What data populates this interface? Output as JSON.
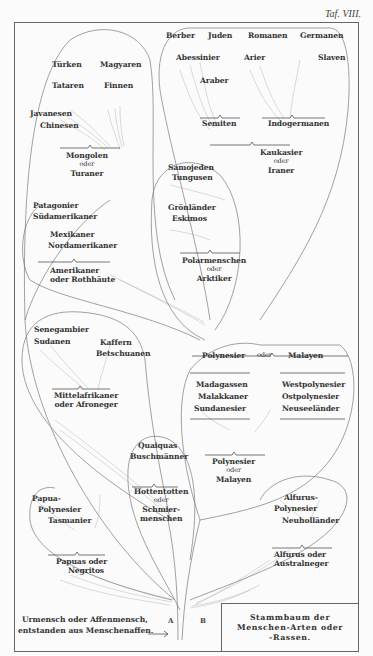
{
  "plate": {
    "title": "Taf. VIII.",
    "legend": {
      "line1": "Stammbaum der",
      "line2": "Menschen-Arten oder",
      "line3": "-Rassen."
    },
    "origin": {
      "line1": "Urmensch oder Affenmensch,",
      "line2": "entstanden aus Menschenaffen.",
      "arrow": "⟶",
      "root_a": "A",
      "root_b": "B"
    }
  },
  "tree": {
    "mongolen": {
      "group": [
        "Mongolen",
        "oder",
        "Turaner"
      ],
      "leaves": [
        "Türken",
        "Magyaren",
        "Tataren",
        "Finnen",
        "Javanesen",
        "Chinesen"
      ]
    },
    "kaukasier": {
      "group": [
        "Kaukasier",
        "oder",
        "Iraner"
      ],
      "subgroups": {
        "semiten": {
          "label": "Semiten",
          "leaves": [
            "Berber",
            "Juden",
            "Abessinier",
            "Araber"
          ]
        },
        "indogermanen": {
          "label": "Indogermanen",
          "leaves": [
            "Romanen",
            "Germanen",
            "Arier",
            "Slaven"
          ]
        }
      }
    },
    "arktiker": {
      "group": [
        "Polarmenschen",
        "oder",
        "Arktiker"
      ],
      "leaves": [
        "Samojeden",
        "Tungusen",
        "Grönländer",
        "Eskimos"
      ]
    },
    "amerikaner": {
      "group": [
        "Amerikaner",
        "oder Rothhäute"
      ],
      "leaves": [
        "Patagonier",
        "Südamerikaner",
        "Mexikaner",
        "Nordamerikaner"
      ]
    },
    "afroneger": {
      "group": [
        "Mittelafrikaner",
        "oder Afroneger"
      ],
      "leaves": [
        "Senegambier",
        "Sudanen",
        "Kaffern",
        "Betschuanen"
      ]
    },
    "polynesier_top": {
      "label": [
        "Polynesier",
        "oder",
        "Malayen"
      ]
    },
    "malayen": {
      "group": [
        "Polynesier",
        "oder",
        "Malayen"
      ],
      "left_leaves": [
        "Madagassen",
        "Malakkaner",
        "Sundanesier"
      ],
      "right_leaves": [
        "Westpolynesier",
        "Ostpolynesier",
        "Neuseeländer"
      ]
    },
    "hottentotten": {
      "group": [
        "Hottentotten",
        "oder",
        "Schmier-",
        "menschen"
      ],
      "leaves": [
        "Quaiquas",
        "Buschmänner"
      ]
    },
    "negritos": {
      "group": [
        "Papuas oder",
        "Negritos"
      ],
      "leaves": [
        "Papua-",
        "Polynesier",
        "Tasmanier"
      ]
    },
    "australneger": {
      "group": [
        "Alfurus oder",
        "Australneger"
      ],
      "leaves": [
        "Alfurus-",
        "Polynesier",
        "Neuholländer"
      ]
    }
  },
  "colors": {
    "ink": "#3a3a3a",
    "paper": "#fbfbfb",
    "line": "#777777"
  }
}
